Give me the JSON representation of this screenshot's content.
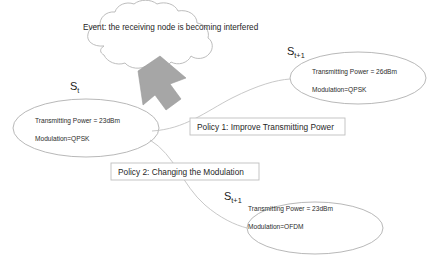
{
  "diagram": {
    "title_text": "",
    "cloud": {
      "text": "Event: the receiving node is becoming interfered"
    },
    "arrow": {
      "name": "down-left-block-arrow",
      "color": "#a6a6a6"
    },
    "states": [
      {
        "id": "state-current",
        "label_main": "S",
        "label_sub": "t",
        "lines": [
          "Transmitting Power = 23dBm",
          "Modulation=QPSK"
        ]
      },
      {
        "id": "state-next-power",
        "label_main": "S",
        "label_sub": "t+1",
        "lines": [
          "Transmitting Power = 26dBm",
          "Modulation=QPSK"
        ]
      },
      {
        "id": "state-next-modulation",
        "label_main": "S",
        "label_sub": "t+1",
        "lines": [
          "Transmitting Power = 23dBm",
          "Modulation=OFDM"
        ]
      }
    ],
    "policies": [
      {
        "id": "policy-1",
        "text": "Policy 1: Improve Transmitting Power"
      },
      {
        "id": "policy-2",
        "text": "Policy 2: Changing the Modulation"
      }
    ],
    "colors": {
      "outline": "#b0b0b0",
      "arrow_fill": "#a6a6a6",
      "box_border": "#bfbfbf",
      "text": "#1a1a1a",
      "background": "#ffffff"
    }
  }
}
